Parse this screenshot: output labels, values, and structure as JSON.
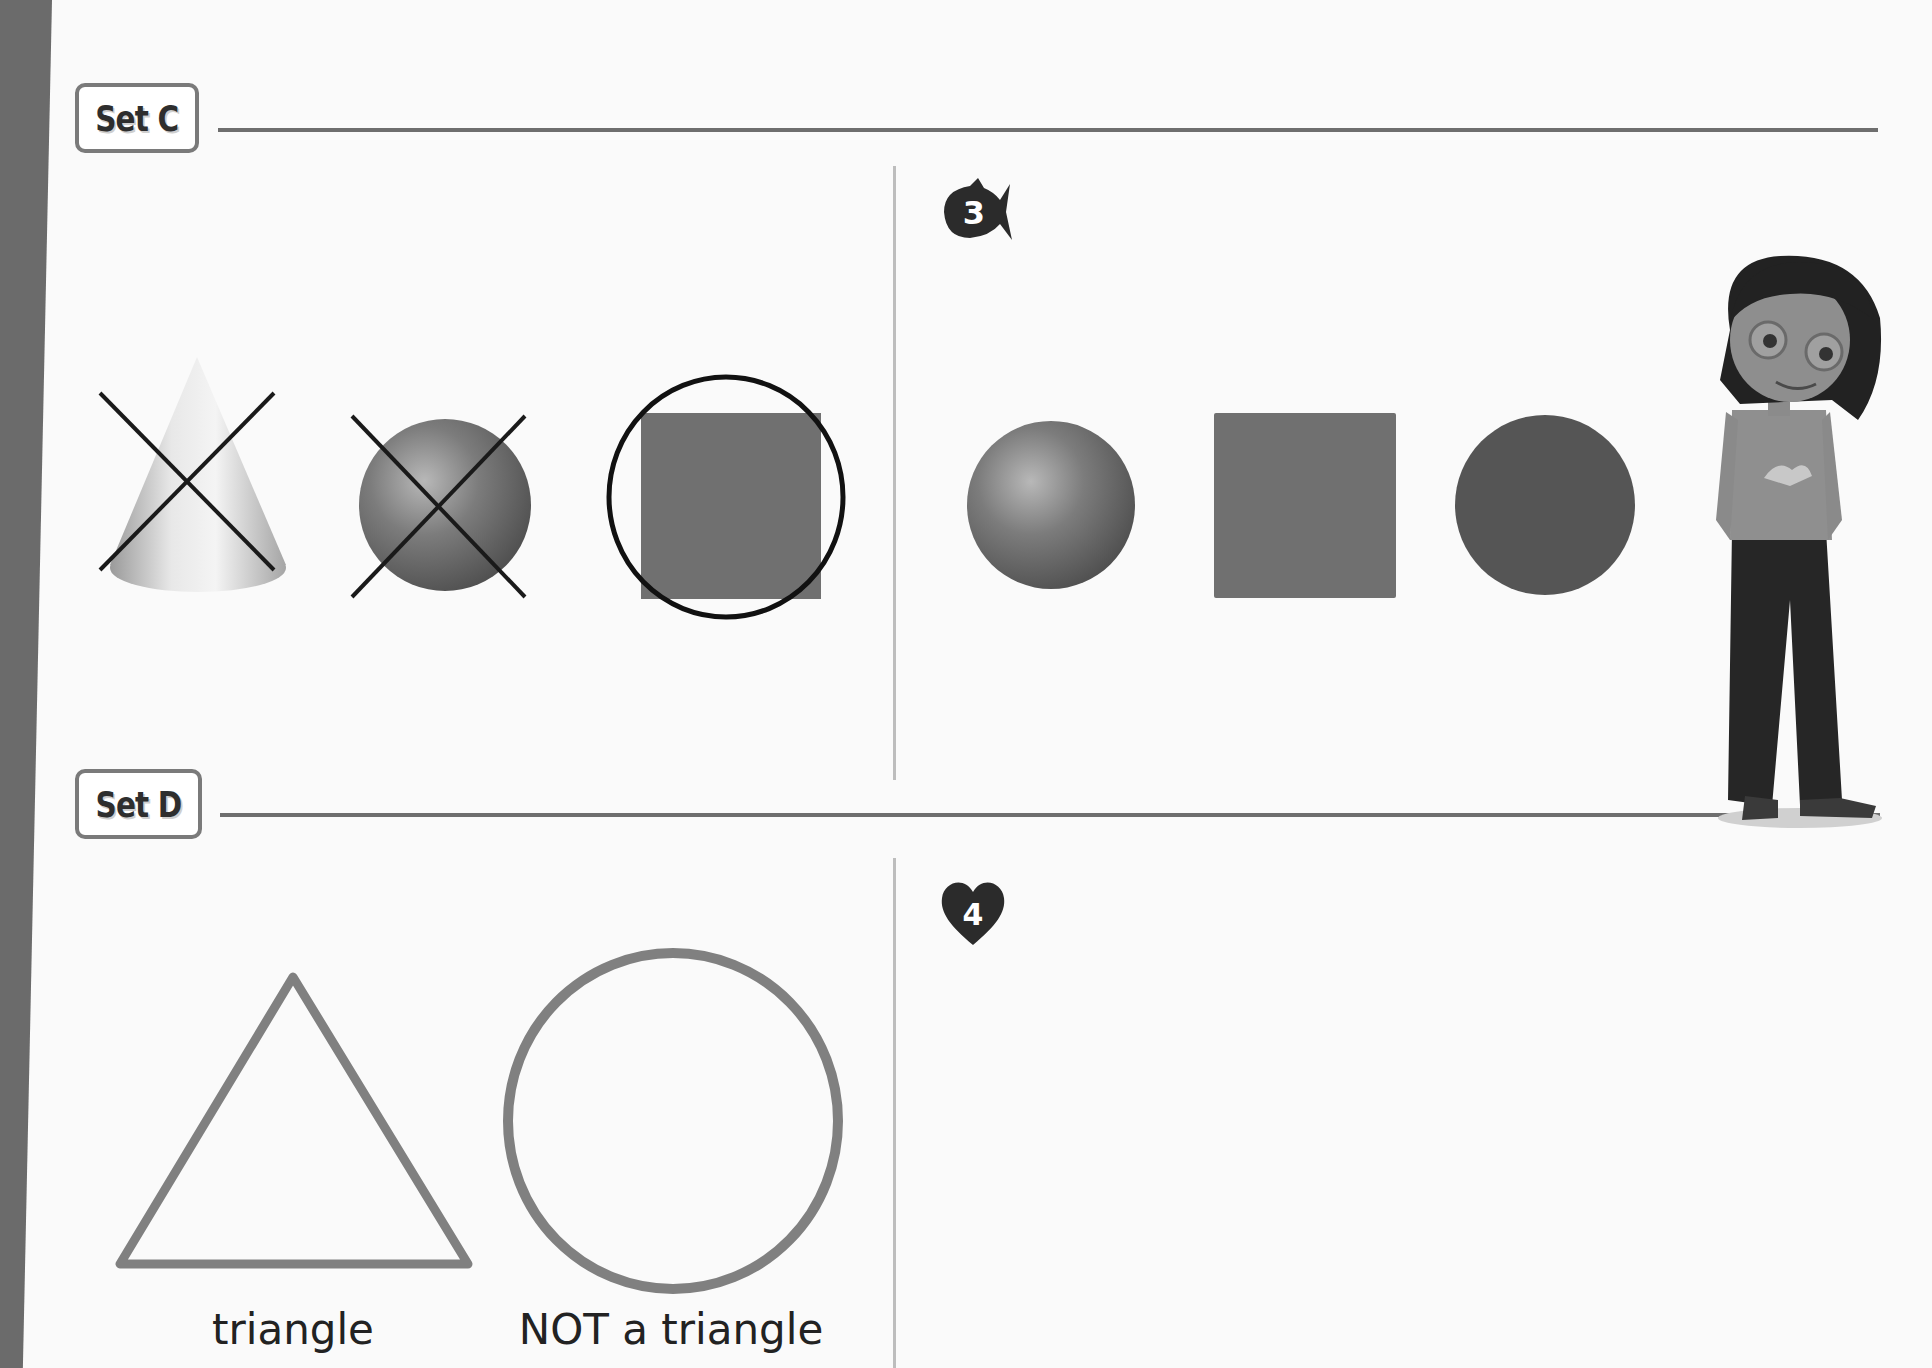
{
  "page": {
    "background": "#fafafa",
    "left_bar_color": "#6b6b6b"
  },
  "set_c": {
    "label": "Set C",
    "example": {
      "shapes": [
        {
          "type": "cone",
          "mark": "crossed-out"
        },
        {
          "type": "sphere",
          "mark": "crossed-out"
        },
        {
          "type": "square",
          "mark": "circled"
        }
      ]
    },
    "problem": {
      "number": "3",
      "badge_icon": "fish-icon",
      "shapes": [
        {
          "type": "sphere"
        },
        {
          "type": "square"
        },
        {
          "type": "circle"
        }
      ]
    }
  },
  "set_d": {
    "label": "Set D",
    "example": {
      "shapes": [
        {
          "type": "triangle",
          "caption": "triangle"
        },
        {
          "type": "circle",
          "caption": "NOT a triangle"
        }
      ]
    },
    "problem": {
      "number": "4",
      "badge_icon": "heart-icon"
    }
  },
  "colors": {
    "shape_fill": "#707070",
    "outline": "#808080",
    "mark": "#1a1a1a",
    "badge_fill": "#2b2b2b"
  }
}
